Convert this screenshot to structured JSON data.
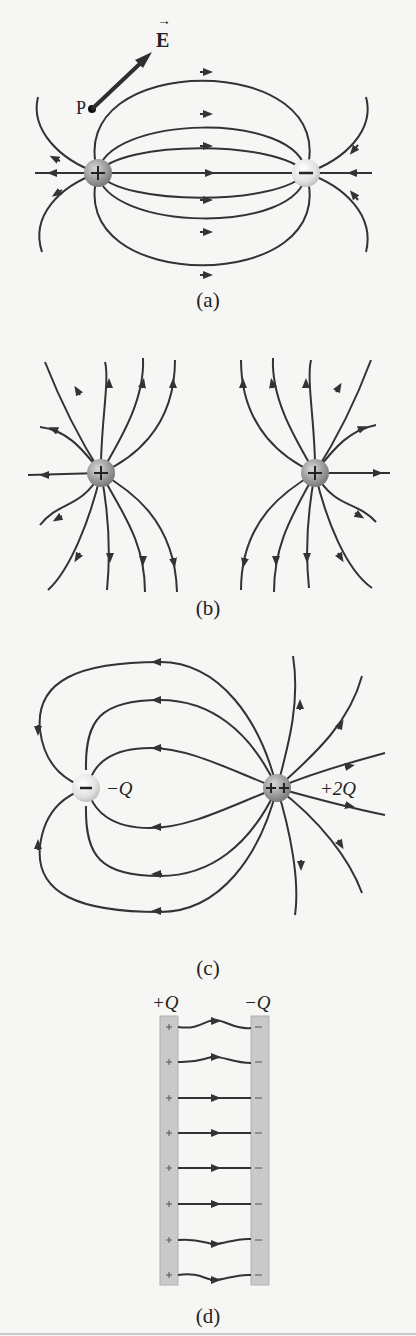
{
  "figure": {
    "panels": [
      {
        "id": "a",
        "caption": "(a)",
        "description": "Electric field lines between equal and opposite charges (dipole)",
        "charges": [
          {
            "sign": "+",
            "label": "+"
          },
          {
            "sign": "-",
            "label": "−"
          }
        ],
        "point_label": "P",
        "vector_label": "E",
        "vector_arrow": "→"
      },
      {
        "id": "b",
        "caption": "(b)",
        "description": "Field lines between two equal positive charges",
        "charges": [
          {
            "sign": "+",
            "label": "+"
          },
          {
            "sign": "+",
            "label": "+"
          }
        ]
      },
      {
        "id": "c",
        "caption": "(c)",
        "description": "Field lines for charges -Q and +2Q",
        "charges": [
          {
            "sign": "-",
            "label": "−",
            "value": "−Q"
          },
          {
            "sign": "++",
            "label": "++",
            "value": "+2Q"
          }
        ]
      },
      {
        "id": "d",
        "caption": "(d)",
        "description": "Field between two parallel plates",
        "plates": [
          {
            "label": "+Q",
            "sign": "+"
          },
          {
            "label": "−Q",
            "sign": "−"
          }
        ],
        "field_line_count": 8
      }
    ],
    "colors": {
      "line": "#333333",
      "positive_charge": "#9a9a9a",
      "negative_charge": "#e4e4e4",
      "plate": "#c9c9c9",
      "background": "#f6f6f4"
    }
  }
}
